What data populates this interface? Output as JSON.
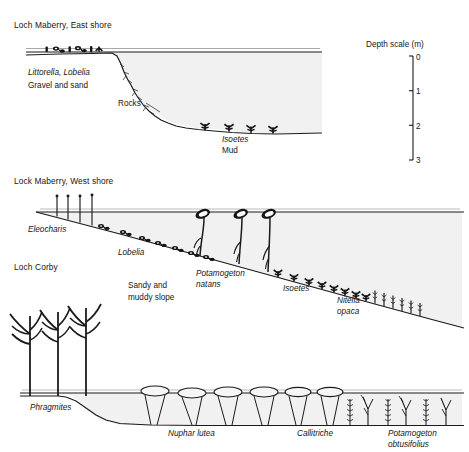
{
  "figure": {
    "kind": "lake-transect-profiles",
    "panels": [
      {
        "id": "loch-maberry-east",
        "title": "Loch Maberry, East shore",
        "labels": [
          {
            "text": "Littorella, Lobelia",
            "style": "italic",
            "x": 28,
            "y": 75
          },
          {
            "text": "Gravel and sand",
            "style": "roman",
            "x": 28,
            "y": 88
          },
          {
            "text": "Rocks",
            "style": "roman",
            "x": 118,
            "y": 106
          },
          {
            "text": "Isoetes",
            "style": "italic",
            "x": 222,
            "y": 142
          },
          {
            "text": "Mud",
            "style": "roman",
            "x": 222,
            "y": 153
          }
        ],
        "plant_groups": [
          {
            "name": "Littorella",
            "count": 3,
            "zone": "shore shallow"
          },
          {
            "name": "Lobelia",
            "count": 3,
            "zone": "shore shallow"
          },
          {
            "name": "Isoetes",
            "count": 4,
            "zone": "deep mud basin"
          }
        ]
      },
      {
        "id": "lock-maberry-west",
        "title": "Lock Maberry, West shore",
        "labels": [
          {
            "text": "Eleocharis",
            "style": "italic",
            "x": 28,
            "y": 232
          },
          {
            "text": "Lobelia",
            "style": "italic",
            "x": 118,
            "y": 255
          },
          {
            "text": "Potamogeton",
            "style": "italic",
            "x": 196,
            "y": 276
          },
          {
            "text": "natans",
            "style": "italic",
            "x": 196,
            "y": 287
          },
          {
            "text": "Sandy and",
            "style": "roman",
            "x": 128,
            "y": 288
          },
          {
            "text": "muddy slope",
            "style": "roman",
            "x": 128,
            "y": 300
          },
          {
            "text": "Isoetes",
            "style": "italic",
            "x": 283,
            "y": 291
          },
          {
            "text": "Nitella",
            "style": "italic",
            "x": 337,
            "y": 303
          },
          {
            "text": "opaca",
            "style": "italic",
            "x": 337,
            "y": 314
          }
        ],
        "plant_groups": [
          {
            "name": "Eleocharis",
            "count": 4,
            "zone": "emergent margin"
          },
          {
            "name": "Lobelia",
            "count": 7,
            "zone": "upper slope"
          },
          {
            "name": "Potamogeton natans",
            "count": 3,
            "zone": "mid slope floating"
          },
          {
            "name": "Isoetes",
            "count": 8,
            "zone": "lower slope"
          },
          {
            "name": "Nitella opaca",
            "count": 6,
            "zone": "deepest slope"
          }
        ]
      },
      {
        "id": "loch-corby",
        "title": "Loch Corby",
        "labels": [
          {
            "text": "Phragmites",
            "style": "italic",
            "x": 30,
            "y": 410
          },
          {
            "text": "Nuphar lutea",
            "style": "italic",
            "x": 168,
            "y": 436
          },
          {
            "text": "Callitriche",
            "style": "italic",
            "x": 297,
            "y": 436
          },
          {
            "text": "Potamogeton",
            "style": "italic",
            "x": 388,
            "y": 436
          },
          {
            "text": "obtusifolius",
            "style": "italic",
            "x": 388,
            "y": 447
          }
        ],
        "plant_groups": [
          {
            "name": "Phragmites",
            "count": 3,
            "zone": "emergent reed bed"
          },
          {
            "name": "Nuphar lutea",
            "count": 6,
            "zone": "floating leaf zone"
          },
          {
            "name": "Callitriche",
            "count": 5,
            "zone": "submerged bottom"
          },
          {
            "name": "Potamogeton obtusifolius",
            "count": 4,
            "zone": "submerged bottom"
          }
        ]
      }
    ],
    "depth_scale": {
      "title": "Depth scale (m)",
      "unit": "m",
      "ticks": [
        "0",
        "1",
        "2",
        "3"
      ],
      "min": 0,
      "max": 3
    },
    "colors": {
      "ink": "#1b1b1b",
      "water_fill": "#f1f1f1",
      "background": "#ffffff"
    }
  }
}
